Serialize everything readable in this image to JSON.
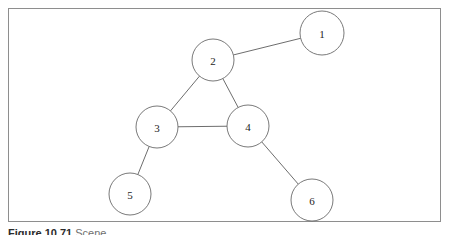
{
  "figure": {
    "frame_border_color": "#8e8e8e",
    "background_color": "#ffffff",
    "node_stroke_color": "#6a6a6a",
    "edge_stroke_color": "#5c5c5c",
    "label_color": "#1d1d1d"
  },
  "caption": {
    "label": "Figure 10.71",
    "text": "Scene..."
  },
  "chart_data": {
    "type": "diagram",
    "subtype": "undirected-graph",
    "title": "",
    "xlabel": "",
    "ylabel": "",
    "grid": false,
    "legend": false,
    "xlim": [
      0,
      451
    ],
    "ylim": [
      0,
      235
    ],
    "nodes": [
      {
        "id": "1",
        "label": "1",
        "cx": 322,
        "cy": 33,
        "r": 22
      },
      {
        "id": "2",
        "label": "2",
        "cx": 213,
        "cy": 60,
        "r": 21
      },
      {
        "id": "3",
        "label": "3",
        "cx": 157,
        "cy": 127,
        "r": 21
      },
      {
        "id": "4",
        "label": "4",
        "cx": 248,
        "cy": 126,
        "r": 21
      },
      {
        "id": "5",
        "label": "5",
        "cx": 130,
        "cy": 194,
        "r": 21
      },
      {
        "id": "6",
        "label": "6",
        "cx": 312,
        "cy": 200,
        "r": 21
      }
    ],
    "edges": [
      {
        "source": "2",
        "target": "1"
      },
      {
        "source": "2",
        "target": "3"
      },
      {
        "source": "2",
        "target": "4"
      },
      {
        "source": "3",
        "target": "4"
      },
      {
        "source": "3",
        "target": "5"
      },
      {
        "source": "4",
        "target": "6"
      }
    ]
  }
}
